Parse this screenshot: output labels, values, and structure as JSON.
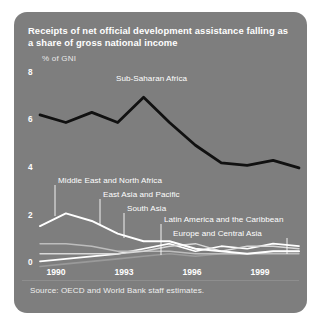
{
  "card": {
    "bg_color": "#7e7e7e",
    "title_line1": "Receipts of net official development assistance falling",
    "title_line2": "as a share of gross national income",
    "subtitle": "% of GNI",
    "source": "Source: OECD and World Bank staff estimates."
  },
  "chart_data": {
    "type": "line",
    "title": "Receipts of net official development assistance falling as a share of gross national income",
    "xlabel": "",
    "ylabel": "% of GNI",
    "ylim": [
      0,
      8
    ],
    "xlim": [
      1990,
      2000
    ],
    "yticks": [
      "0",
      "2",
      "4",
      "6",
      "8"
    ],
    "ytick_values": [
      0,
      2,
      4,
      6,
      8
    ],
    "xticks": [
      "1990",
      "1993",
      "1996",
      "1999"
    ],
    "xtick_values": [
      1990,
      1993,
      1996,
      1999
    ],
    "grid": false,
    "legend": "inline-labels",
    "x": [
      1990,
      1991,
      1992,
      1993,
      1994,
      1995,
      1996,
      1997,
      1998,
      1999,
      2000
    ],
    "series": [
      {
        "name": "Sub-Saharan Africa",
        "color": "#111111",
        "width": 2.8,
        "values": [
          6.3,
          6.0,
          6.4,
          6.0,
          7.0,
          6.0,
          5.1,
          4.4,
          4.3,
          4.5,
          4.2
        ]
      },
      {
        "name": "Middle East and North Africa",
        "color": "#ffffff",
        "width": 2.0,
        "values": [
          1.9,
          2.4,
          2.1,
          1.6,
          1.3,
          1.3,
          1.0,
          0.9,
          0.8,
          0.9,
          0.9
        ]
      },
      {
        "name": "East Asia and Pacific",
        "color": "#d8d8d8",
        "width": 1.4,
        "values": [
          0.8,
          0.8,
          0.8,
          0.8,
          0.9,
          1.1,
          1.2,
          0.9,
          1.1,
          1.1,
          1.0
        ]
      },
      {
        "name": "South Asia",
        "color": "#bdbdbd",
        "width": 1.4,
        "values": [
          1.2,
          1.2,
          1.1,
          0.9,
          0.9,
          0.9,
          0.8,
          0.8,
          0.8,
          0.8,
          0.8
        ]
      },
      {
        "name": "Latin America and the Caribbean",
        "color": "#ffffff",
        "width": 1.7,
        "values": [
          0.5,
          0.6,
          0.7,
          0.8,
          1.0,
          1.2,
          0.9,
          1.1,
          1.0,
          1.2,
          1.1
        ]
      },
      {
        "name": "Europe and Central Asia",
        "color": "#9a9a9a",
        "width": 1.6,
        "values": [
          0.3,
          0.4,
          0.5,
          0.6,
          0.7,
          0.8,
          0.7,
          0.8,
          0.8,
          0.9,
          0.9
        ]
      }
    ],
    "annotations": [
      {
        "text": "Sub-Saharan Africa",
        "series": "Sub-Saharan Africa"
      },
      {
        "text": "Middle East and North Africa",
        "series": "Middle East and North Africa"
      },
      {
        "text": "East Asia and Pacific",
        "series": "East Asia and Pacific"
      },
      {
        "text": "South Asia",
        "series": "South Asia"
      },
      {
        "text": "Latin America and the Caribbean",
        "series": "Latin America and the Caribbean"
      },
      {
        "text": "Europe and Central Asia",
        "series": "Europe and Central Asia"
      }
    ]
  }
}
